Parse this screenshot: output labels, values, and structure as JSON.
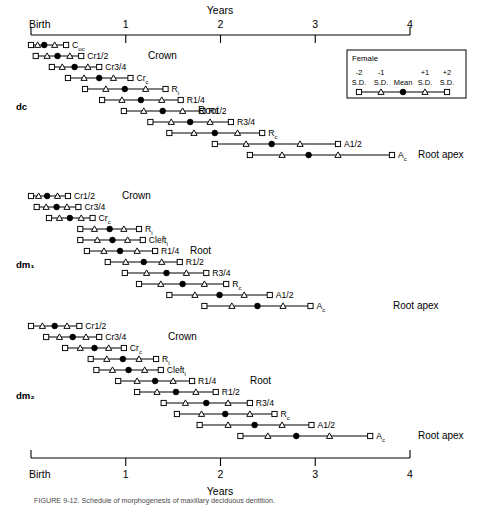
{
  "figure": {
    "axis_title_top": "Years",
    "axis_title_bottom": "Years",
    "birth_label_top": "Birth",
    "birth_label_bottom": "Birth",
    "tick_labels": [
      "1",
      "2",
      "3",
      "4"
    ],
    "caption": "FIGURE 9-12.  Schedule of morphogenesis of maxillary deciduous dentition."
  },
  "legend": {
    "title": "Female",
    "sd_top": [
      "-2",
      "-1",
      "+1",
      "+2"
    ],
    "sd_bottom": [
      "S.D.",
      "S.D.",
      "Mean",
      "S.D.",
      "S.D."
    ],
    "marker_values": [
      -2,
      -1,
      0,
      1,
      2
    ]
  },
  "stage_labels": {
    "crown": "Crown",
    "root": "Root",
    "root_apex": "Root apex"
  },
  "chart_data": {
    "type": "scatter",
    "title": "Schedule of morphogenesis of maxillary deciduous dentition",
    "xlabel": "Years",
    "ylabel": "",
    "xlim": [
      0,
      4
    ],
    "x_ticks": [
      0,
      1,
      2,
      3,
      4
    ],
    "x_tick_labels": [
      "Birth",
      "1",
      "2",
      "3",
      "4"
    ],
    "grid": false,
    "legend_position": "top-right",
    "marker_semantics": {
      "square": "±2 S.D.",
      "triangle": "±1 S.D.",
      "filled_circle": "Mean"
    },
    "groups": [
      {
        "name": "dc",
        "label": "dc",
        "rows": [
          {
            "label": "C",
            "sub": "oc",
            "stage": "Crown",
            "minus2sd": 0.0,
            "minus1sd": 0.07,
            "mean": 0.14,
            "plus1sd": 0.25,
            "plus2sd": 0.37
          },
          {
            "label": "Cr1/2",
            "sub": "",
            "stage": "Crown",
            "minus2sd": 0.05,
            "minus1sd": 0.17,
            "mean": 0.28,
            "plus1sd": 0.41,
            "plus2sd": 0.53
          },
          {
            "label": "Cr3/4",
            "sub": "",
            "stage": "Crown",
            "minus2sd": 0.22,
            "minus1sd": 0.33,
            "mean": 0.46,
            "plus1sd": 0.6,
            "plus2sd": 0.72
          },
          {
            "label": "Cr",
            "sub": "c",
            "stage": "Crown",
            "minus2sd": 0.39,
            "minus1sd": 0.56,
            "mean": 0.72,
            "plus1sd": 0.87,
            "plus2sd": 1.05
          },
          {
            "label": "R",
            "sub": "i",
            "stage": "Root",
            "minus2sd": 0.57,
            "minus1sd": 0.79,
            "mean": 0.99,
            "plus1sd": 1.21,
            "plus2sd": 1.42
          },
          {
            "label": "R1/4",
            "sub": "",
            "stage": "Root",
            "minus2sd": 0.75,
            "minus1sd": 0.96,
            "mean": 1.16,
            "plus1sd": 1.38,
            "plus2sd": 1.58
          },
          {
            "label": "R1/2",
            "sub": "",
            "stage": "Root",
            "minus2sd": 0.98,
            "minus1sd": 1.19,
            "mean": 1.39,
            "plus1sd": 1.6,
            "plus2sd": 1.81
          },
          {
            "label": "R3/4",
            "sub": "",
            "stage": "Root",
            "minus2sd": 1.26,
            "minus1sd": 1.48,
            "mean": 1.68,
            "plus1sd": 1.89,
            "plus2sd": 2.11
          },
          {
            "label": "R",
            "sub": "c",
            "stage": "Root",
            "minus2sd": 1.46,
            "minus1sd": 1.72,
            "mean": 1.94,
            "plus1sd": 2.18,
            "plus2sd": 2.44
          },
          {
            "label": "A1/2",
            "sub": "",
            "stage": "Root apex",
            "minus2sd": 1.94,
            "minus1sd": 2.27,
            "mean": 2.54,
            "plus1sd": 2.84,
            "plus2sd": 3.24
          },
          {
            "label": "A",
            "sub": "c",
            "stage": "Root apex",
            "minus2sd": 2.31,
            "minus1sd": 2.65,
            "mean": 2.93,
            "plus1sd": 3.24,
            "plus2sd": 3.81
          }
        ]
      },
      {
        "name": "dm1",
        "label": "dm₁",
        "rows": [
          {
            "label": "Cr1/2",
            "sub": "",
            "stage": "Crown",
            "minus2sd": 0.0,
            "minus1sd": 0.08,
            "mean": 0.17,
            "plus1sd": 0.28,
            "plus2sd": 0.39
          },
          {
            "label": "Cr3/4",
            "sub": "",
            "stage": "Crown",
            "minus2sd": 0.06,
            "minus1sd": 0.16,
            "mean": 0.27,
            "plus1sd": 0.38,
            "plus2sd": 0.5
          },
          {
            "label": "Cr",
            "sub": "c",
            "stage": "Crown",
            "minus2sd": 0.19,
            "minus1sd": 0.3,
            "mean": 0.41,
            "plus1sd": 0.53,
            "plus2sd": 0.65
          },
          {
            "label": "R",
            "sub": "i",
            "stage": "Root",
            "minus2sd": 0.52,
            "minus1sd": 0.67,
            "mean": 0.83,
            "plus1sd": 0.98,
            "plus2sd": 1.14
          },
          {
            "label": "Cleft",
            "sub": "i",
            "stage": "Root",
            "minus2sd": 0.52,
            "minus1sd": 0.7,
            "mean": 0.86,
            "plus1sd": 1.02,
            "plus2sd": 1.18
          },
          {
            "label": "R1/4",
            "sub": "",
            "stage": "Root",
            "minus2sd": 0.59,
            "minus1sd": 0.77,
            "mean": 0.94,
            "plus1sd": 1.12,
            "plus2sd": 1.31
          },
          {
            "label": "R1/2",
            "sub": "",
            "stage": "Root",
            "minus2sd": 0.81,
            "minus1sd": 1.0,
            "mean": 1.19,
            "plus1sd": 1.38,
            "plus2sd": 1.57
          },
          {
            "label": "R3/4",
            "sub": "",
            "stage": "Root",
            "minus2sd": 0.99,
            "minus1sd": 1.22,
            "mean": 1.43,
            "plus1sd": 1.64,
            "plus2sd": 1.85
          },
          {
            "label": "R",
            "sub": "c",
            "stage": "Root",
            "minus2sd": 1.14,
            "minus1sd": 1.37,
            "mean": 1.6,
            "plus1sd": 1.83,
            "plus2sd": 2.06
          },
          {
            "label": "A1/2",
            "sub": "",
            "stage": "Root apex",
            "minus2sd": 1.46,
            "minus1sd": 1.73,
            "mean": 1.99,
            "plus1sd": 2.25,
            "plus2sd": 2.52
          },
          {
            "label": "A",
            "sub": "c",
            "stage": "Root apex",
            "minus2sd": 1.83,
            "minus1sd": 2.12,
            "mean": 2.39,
            "plus1sd": 2.66,
            "plus2sd": 2.95
          }
        ]
      },
      {
        "name": "dm2",
        "label": "dm₂",
        "rows": [
          {
            "label": "Cr1/2",
            "sub": "",
            "stage": "Crown",
            "minus2sd": 0.0,
            "minus1sd": 0.12,
            "mean": 0.25,
            "plus1sd": 0.38,
            "plus2sd": 0.51
          },
          {
            "label": "Cr3/4",
            "sub": "",
            "stage": "Crown",
            "minus2sd": 0.16,
            "minus1sd": 0.3,
            "mean": 0.44,
            "plus1sd": 0.58,
            "plus2sd": 0.72
          },
          {
            "label": "Cr",
            "sub": "c",
            "stage": "Crown",
            "minus2sd": 0.36,
            "minus1sd": 0.52,
            "mean": 0.67,
            "plus1sd": 0.82,
            "plus2sd": 0.98
          },
          {
            "label": "R",
            "sub": "i",
            "stage": "Root",
            "minus2sd": 0.63,
            "minus1sd": 0.8,
            "mean": 0.97,
            "plus1sd": 1.14,
            "plus2sd": 1.32
          },
          {
            "label": "Cleft",
            "sub": "i",
            "stage": "Root",
            "minus2sd": 0.69,
            "minus1sd": 0.86,
            "mean": 1.03,
            "plus1sd": 1.2,
            "plus2sd": 1.37
          },
          {
            "label": "R1/4",
            "sub": "",
            "stage": "Root",
            "minus2sd": 0.92,
            "minus1sd": 1.12,
            "mean": 1.31,
            "plus1sd": 1.5,
            "plus2sd": 1.7
          },
          {
            "label": "R1/2",
            "sub": "",
            "stage": "Root",
            "minus2sd": 1.12,
            "minus1sd": 1.33,
            "mean": 1.53,
            "plus1sd": 1.74,
            "plus2sd": 1.95
          },
          {
            "label": "R3/4",
            "sub": "",
            "stage": "Root",
            "minus2sd": 1.4,
            "minus1sd": 1.63,
            "mean": 1.85,
            "plus1sd": 2.08,
            "plus2sd": 2.31
          },
          {
            "label": "R",
            "sub": "c",
            "stage": "Root",
            "minus2sd": 1.54,
            "minus1sd": 1.8,
            "mean": 2.05,
            "plus1sd": 2.31,
            "plus2sd": 2.57
          },
          {
            "label": "A1/2",
            "sub": "",
            "stage": "Root apex",
            "minus2sd": 1.78,
            "minus1sd": 2.08,
            "mean": 2.36,
            "plus1sd": 2.65,
            "plus2sd": 2.96
          },
          {
            "label": "A",
            "sub": "c",
            "stage": "Root apex",
            "minus2sd": 2.21,
            "minus1sd": 2.5,
            "mean": 2.8,
            "plus1sd": 3.15,
            "plus2sd": 3.58
          }
        ]
      }
    ]
  }
}
